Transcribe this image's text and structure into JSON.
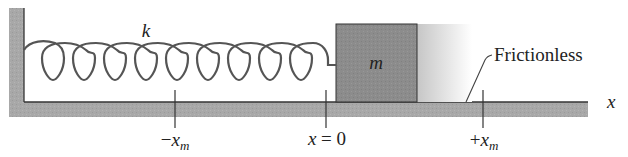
{
  "diagram": {
    "spring_label": "k",
    "block_label": "m",
    "surface_label": "Frictionless",
    "axis_label": "x",
    "ticks": [
      {
        "position": "-x_m",
        "prefix": "−",
        "var": "x",
        "sub": "m"
      },
      {
        "position": "x=0",
        "text": "x = 0"
      },
      {
        "position": "+x_m",
        "prefix": "+",
        "var": "x",
        "sub": "m"
      }
    ],
    "colors": {
      "wall_floor_fill": "#a9a9a9",
      "edge_line": "#333333",
      "block_fill": "#8c8c8c",
      "spring_stroke": "#555555",
      "ghost_gradient_start": "#c8c8c8",
      "ghost_gradient_end": "#ffffff",
      "text": "#222222"
    },
    "spring_loops": 9
  }
}
